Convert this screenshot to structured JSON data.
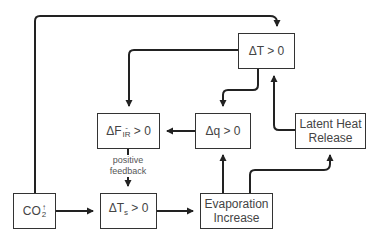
{
  "diagram": {
    "type": "flowchart",
    "title": "",
    "nodes": {
      "delta_t": {
        "main": "ΔT",
        "rel": " > 0"
      },
      "delta_f_ir": {
        "main": "ΔF",
        "sup": "-",
        "sub": "IR",
        "rel": " > 0"
      },
      "delta_q": {
        "main": "Δq",
        "rel": " > 0"
      },
      "latent_heat": {
        "line1": "Latent Heat",
        "line2": "Release"
      },
      "co2": {
        "main": "CO",
        "sup": "↑",
        "sub": "2"
      },
      "delta_ts": {
        "main": "ΔT",
        "sub": "s",
        "rel": " > 0"
      },
      "evaporation": {
        "line1": "Evaporation",
        "line2": "Increase"
      }
    },
    "annotations": {
      "feedback_line1": "positive",
      "feedback_line2": "feedback"
    },
    "edges": [
      {
        "from": "CO2↑",
        "to": "ΔT > 0"
      },
      {
        "from": "CO2↑",
        "to": "ΔTs > 0"
      },
      {
        "from": "ΔT > 0",
        "to": "ΔF_IR > 0"
      },
      {
        "from": "ΔT > 0",
        "to": "Δq > 0"
      },
      {
        "from": "Δq > 0",
        "to": "ΔF_IR > 0"
      },
      {
        "from": "ΔF_IR > 0",
        "to": "ΔTs > 0",
        "label": "positive feedback"
      },
      {
        "from": "ΔTs > 0",
        "to": "Evaporation Increase"
      },
      {
        "from": "Evaporation Increase",
        "to": "Δq > 0"
      },
      {
        "from": "Evaporation Increase",
        "to": "Latent Heat Release"
      },
      {
        "from": "Latent Heat Release",
        "to": "ΔT > 0"
      }
    ],
    "colors": {
      "line": "#222222",
      "text": "#444444",
      "background": "#ffffff"
    }
  }
}
